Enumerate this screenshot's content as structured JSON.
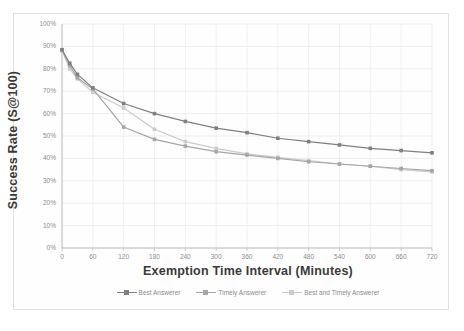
{
  "chart_data": {
    "type": "line",
    "title": "",
    "xlabel": "Exemption Time Interval (Minutes)",
    "ylabel": "Success Rate (S@100)",
    "xlim": [
      0,
      720
    ],
    "ylim": [
      0,
      1.0
    ],
    "grid": true,
    "legend_position": "bottom",
    "x_tick_labels": [
      "0",
      "60",
      "120",
      "180",
      "240",
      "300",
      "360",
      "420",
      "480",
      "540",
      "600",
      "660",
      "720"
    ],
    "x_ticks": [
      0,
      60,
      120,
      180,
      240,
      300,
      360,
      420,
      480,
      540,
      600,
      660,
      720
    ],
    "y_tick_labels": [
      "0%",
      "10%",
      "20%",
      "30%",
      "40%",
      "50%",
      "60%",
      "70%",
      "80%",
      "90%",
      "100%"
    ],
    "y_ticks": [
      0,
      10,
      20,
      30,
      40,
      50,
      60,
      70,
      80,
      90,
      100
    ],
    "x": [
      0,
      15,
      30,
      60,
      120,
      180,
      240,
      300,
      360,
      420,
      480,
      540,
      600,
      660,
      720
    ],
    "series": [
      {
        "name": "Best Answerer",
        "color": "#808080",
        "marker": "square",
        "values": [
          88.5,
          82.5,
          77.5,
          71.5,
          64.5,
          60.0,
          56.5,
          53.5,
          51.5,
          49.0,
          47.5,
          46.0,
          44.5,
          43.5,
          42.5
        ]
      },
      {
        "name": "Timely Answerer",
        "color": "#a6a6a6",
        "marker": "square",
        "values": [
          88.5,
          81.5,
          76.0,
          71.0,
          54.0,
          48.5,
          45.5,
          43.0,
          41.5,
          40.0,
          38.5,
          37.5,
          36.5,
          35.5,
          34.5
        ]
      },
      {
        "name": "Best and Timely Answerer",
        "color": "#cccccc",
        "marker": "square",
        "values": [
          88.0,
          80.0,
          75.5,
          69.5,
          62.5,
          53.0,
          47.5,
          44.5,
          42.0,
          40.5,
          39.0,
          37.5,
          36.5,
          35.0,
          34.0
        ]
      }
    ]
  },
  "axis": {
    "y_title": "Success Rate (S@100)",
    "x_title": "Exemption Time Interval (Minutes)"
  }
}
